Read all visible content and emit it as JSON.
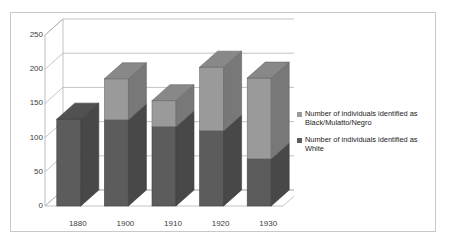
{
  "chart_data": {
    "type": "bar",
    "subtype": "stacked-3d-column",
    "title": "",
    "xlabel": "",
    "ylabel": "",
    "categories": [
      "1880",
      "1900",
      "1910",
      "1920",
      "1930"
    ],
    "ylim": [
      0,
      250
    ],
    "yticks": [
      0,
      50,
      100,
      150,
      200,
      250
    ],
    "grid": true,
    "legend_position": "right",
    "series": [
      {
        "name": "Number of individuals identified as White",
        "color": "#5c5c5c",
        "values": [
          127,
          126,
          116,
          110,
          69
        ]
      },
      {
        "name": "Number of individuals identified as Black/Mulatto/Negro",
        "color": "#9a9a9a",
        "values": [
          0,
          60,
          38,
          93,
          118
        ]
      }
    ],
    "totals": [
      127,
      186,
      154,
      203,
      187
    ]
  },
  "legend": {
    "entries": [
      {
        "label": "Number of individuals identified as Black/Mulatto/Negro",
        "color": "#9a9a9a"
      },
      {
        "label": "Number of individuals identified as White",
        "color": "#5c5c5c"
      }
    ]
  },
  "axis": {
    "y_tick_labels": [
      "250",
      "200",
      "150",
      "100",
      "50",
      "0"
    ],
    "x_tick_labels": [
      "1880",
      "1900",
      "1910",
      "1920",
      "1930"
    ]
  },
  "colors": {
    "series_light": "#9a9a9a",
    "series_dark": "#5c5c5c",
    "grid": "#b4b4b4",
    "frame": "#c9c9c9",
    "text": "#3d3d3d",
    "background": "#ffffff"
  }
}
